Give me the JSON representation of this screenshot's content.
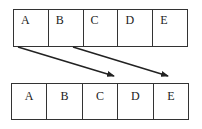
{
  "top_row": {
    "cells": [
      "A",
      "B",
      "C",
      "D",
      "E"
    ]
  },
  "bottom_row": {
    "cells": [
      "A",
      "B",
      "C",
      "D",
      "E"
    ]
  },
  "arrows": [
    {
      "from": "top_row.A",
      "to": "bottom_row.C"
    },
    {
      "from": "top_row.B",
      "to": "bottom_row.E"
    }
  ],
  "colors": {
    "line": "#222222",
    "background": "#ffffff"
  }
}
